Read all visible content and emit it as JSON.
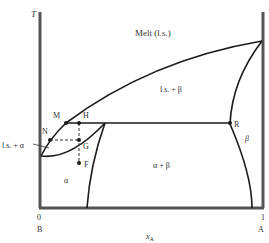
{
  "diagram": {
    "type": "binary phase diagram (liquid-solid, eutectic with solid solutions)",
    "axes": {
      "y_label": "T",
      "x_label": "x",
      "x_label_sub": "A",
      "x_min_tick": "0",
      "x_max_tick": "1",
      "left_component": "B",
      "right_component": "A"
    },
    "regions": {
      "melt": "Melt (l.s.)",
      "ls_beta": "l.s. + β",
      "beta": "β",
      "alpha_beta": "α + β",
      "alpha": "α",
      "ls_alpha": "l.s. + α"
    },
    "points": {
      "M": "M",
      "H": "H",
      "R": "R",
      "N": "N",
      "G": "G",
      "F": "F"
    },
    "colors": {
      "axis": "#555555",
      "curve": "#1a1a1a",
      "text": "#333333"
    }
  }
}
